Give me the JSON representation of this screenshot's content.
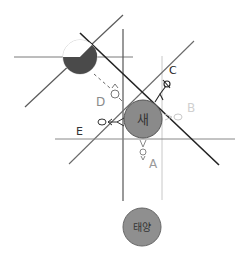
{
  "diagram": {
    "bodies": {
      "center": {
        "label": "새",
        "fill": "#8a8a8a"
      },
      "sun": {
        "label": "태양",
        "fill": "#8f8f8f"
      },
      "moon": {
        "dark_fill": "#4a4a4a",
        "light_fill": "#d8d8d8"
      }
    },
    "positions": {
      "A": {
        "label": "A",
        "color": "#9a9a9a"
      },
      "B": {
        "label": "B",
        "color": "#d0d0d0"
      },
      "C": {
        "label": "C",
        "color": "#222222"
      },
      "D": {
        "label": "D",
        "color": "#8a8a8a"
      },
      "E": {
        "label": "E",
        "color": "#333333"
      }
    },
    "colors": {
      "dark_line": "#333333",
      "mid_line": "#6f6f6f",
      "light_line": "#bdbdbd"
    }
  }
}
